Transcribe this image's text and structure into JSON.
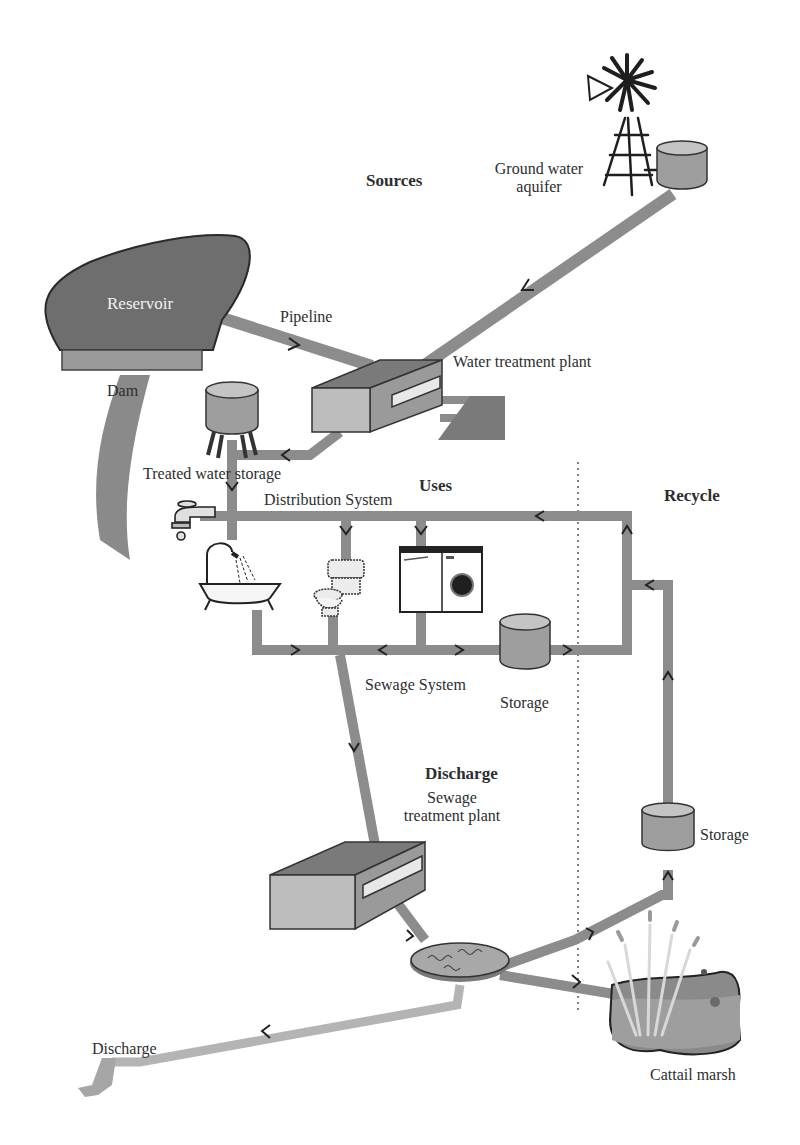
{
  "diagram": {
    "colors": {
      "pipe": "#8c8c8c",
      "pipe_light": "#b4b4b4",
      "reservoir": "#6e6e6e",
      "dam": "#9a9a9a",
      "tank": "#9e9e9e",
      "tank_top": "#c4c4c4",
      "plant_front": "#bdbdbd",
      "plant_top": "#7a7a7a",
      "plant_side": "#9a9a9a",
      "divider": "#555555",
      "arrow": "#222222"
    },
    "sections": {
      "sources": "Sources",
      "uses": "Uses",
      "recycle": "Recycle",
      "discharge": "Discharge"
    },
    "labels": {
      "reservoir": "Reservoir",
      "pipeline": "Pipeline",
      "dam": "Dam",
      "ground_water_line1": "Ground water",
      "ground_water_line2": "aquifer",
      "water_treatment_plant": "Water treatment plant",
      "treated_water_storage": "Treated water storage",
      "distribution_system": "Distribution System",
      "sewage_system": "Sewage System",
      "storage_uses": "Storage",
      "sewage_treatment_line1": "Sewage",
      "sewage_treatment_line2": "treatment plant",
      "storage_recycle": "Storage",
      "discharge_outlet": "Discharge",
      "cattail_marsh": "Cattail marsh"
    },
    "nodes": [
      {
        "id": "ground-water-aquifer",
        "label": "Ground water aquifer",
        "icon": "windmill-icon"
      },
      {
        "id": "reservoir",
        "label": "Reservoir",
        "icon": "reservoir-icon"
      },
      {
        "id": "dam",
        "label": "Dam",
        "icon": "dam-icon"
      },
      {
        "id": "water-treatment-plant",
        "label": "Water treatment plant",
        "icon": "plant-icon"
      },
      {
        "id": "treated-water-storage",
        "label": "Treated water storage",
        "icon": "water-tower-icon"
      },
      {
        "id": "faucet",
        "label": "",
        "icon": "faucet-icon"
      },
      {
        "id": "bathtub",
        "label": "",
        "icon": "bathtub-icon"
      },
      {
        "id": "toilet",
        "label": "",
        "icon": "toilet-icon"
      },
      {
        "id": "washer-dryer",
        "label": "",
        "icon": "washing-machine-icon"
      },
      {
        "id": "storage-uses",
        "label": "Storage",
        "icon": "tank-icon"
      },
      {
        "id": "sewage-treatment-plant",
        "label": "Sewage treatment plant",
        "icon": "plant-icon"
      },
      {
        "id": "settling-pond",
        "label": "",
        "icon": "pond-icon"
      },
      {
        "id": "storage-recycle",
        "label": "Storage",
        "icon": "tank-icon"
      },
      {
        "id": "cattail-marsh",
        "label": "Cattail marsh",
        "icon": "marsh-icon"
      },
      {
        "id": "discharge",
        "label": "Discharge",
        "icon": "outlet-icon"
      }
    ],
    "edges": [
      {
        "from": "ground-water-aquifer",
        "to": "water-treatment-plant"
      },
      {
        "from": "reservoir",
        "to": "water-treatment-plant",
        "label": "Pipeline"
      },
      {
        "from": "water-treatment-plant",
        "to": "treated-water-storage"
      },
      {
        "from": "treated-water-storage",
        "to": "distribution-system"
      },
      {
        "from": "distribution-system",
        "to": "toilet"
      },
      {
        "from": "distribution-system",
        "to": "washer-dryer"
      },
      {
        "from": "uses",
        "to": "sewage-system"
      },
      {
        "from": "sewage-system",
        "to": "storage-uses"
      },
      {
        "from": "storage-uses",
        "to": "distribution-system",
        "label": "Recycle"
      },
      {
        "from": "sewage-system",
        "to": "sewage-treatment-plant"
      },
      {
        "from": "sewage-treatment-plant",
        "to": "settling-pond"
      },
      {
        "from": "settling-pond",
        "to": "storage-recycle"
      },
      {
        "from": "storage-recycle",
        "to": "distribution-system"
      },
      {
        "from": "settling-pond",
        "to": "cattail-marsh"
      },
      {
        "from": "settling-pond",
        "to": "discharge"
      }
    ]
  }
}
